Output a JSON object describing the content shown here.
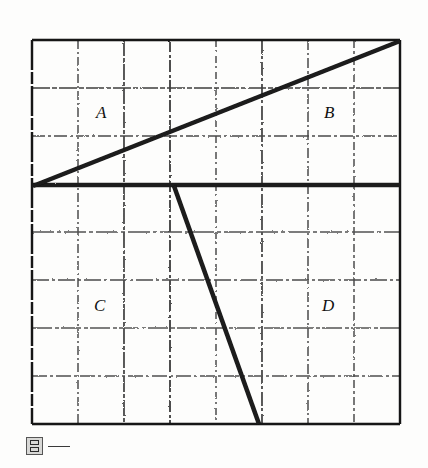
{
  "figure": {
    "caption": "图一",
    "caption_icon": "figure-mark-icon",
    "background_color": "#fdfdfc",
    "ink_color": "#1a1a1a",
    "grid_color": "#5a5a5a",
    "border_color": "#161616",
    "grid": {
      "columns": 8,
      "rows": 8,
      "left": 32,
      "top": 40,
      "right": 400,
      "bottom": 424,
      "cell_width": 46,
      "cell_height": 48,
      "x_ticks": [
        32,
        78,
        124,
        170,
        216,
        262,
        308,
        354,
        400
      ],
      "y_ticks": [
        40,
        88,
        136,
        184,
        232,
        280,
        328,
        376,
        424
      ],
      "style": "dashed-hand-drawn"
    },
    "labels": [
      {
        "text": "A",
        "x": 96,
        "y": 104,
        "region": "upper-left"
      },
      {
        "text": "B",
        "x": 324,
        "y": 104,
        "region": "upper-right"
      },
      {
        "text": "C",
        "x": 94,
        "y": 297,
        "region": "lower-left"
      },
      {
        "text": "D",
        "x": 322,
        "y": 297,
        "region": "lower-right"
      }
    ],
    "strokes": [
      {
        "name": "axis-horizontal",
        "x1": 32,
        "y1": 185,
        "x2": 400,
        "y2": 185,
        "width": 4.5,
        "description": "thick horizontal dividing line at row 3"
      },
      {
        "name": "rising-line",
        "x1": 33,
        "y1": 186,
        "x2": 400,
        "y2": 41,
        "width": 4.5,
        "description": "ascending line from left edge at mid-height to top-right corner"
      },
      {
        "name": "falling-line",
        "x1": 174,
        "y1": 186,
        "x2": 259,
        "y2": 424,
        "width": 4.5,
        "description": "steep descending line from the horizontal axis down to the bottom border"
      }
    ]
  },
  "chart_data": {
    "type": "line",
    "title": "图一",
    "xlabel": "",
    "ylabel": "",
    "xlim": [
      0,
      8
    ],
    "ylim": [
      0,
      8
    ],
    "grid": true,
    "legend": null,
    "annotations": [
      {
        "text": "A",
        "x": 1.4,
        "y": 6.3
      },
      {
        "text": "B",
        "x": 6.35,
        "y": 6.3
      },
      {
        "text": "C",
        "x": 1.35,
        "y": 2.35
      },
      {
        "text": "D",
        "x": 6.3,
        "y": 2.35
      }
    ],
    "series": [
      {
        "name": "horizontal-axis",
        "points": [
          [
            0,
            5
          ],
          [
            8,
            5
          ]
        ]
      },
      {
        "name": "rising-line",
        "points": [
          [
            0,
            5
          ],
          [
            8,
            8
          ]
        ]
      },
      {
        "name": "falling-line",
        "points": [
          [
            3.09,
            5
          ],
          [
            4.93,
            0
          ]
        ]
      }
    ]
  }
}
